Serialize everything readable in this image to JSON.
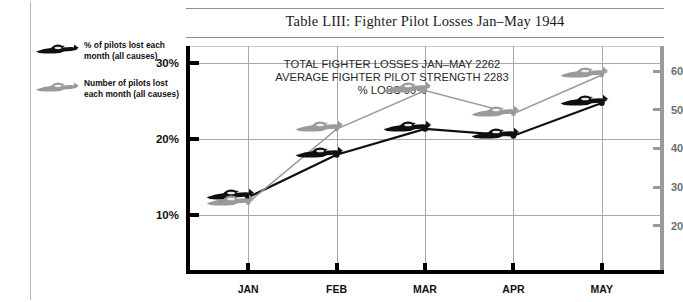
{
  "title": "Table LIII: Fighter Pilot Losses Jan–May 1944",
  "annotation": "TOTAL FIGHTER LOSSES JAN–MAY 2262\nAVERAGE FIGHTER PILOT STRENGTH 2283\n% LOSS 99%",
  "legend": [
    {
      "label": "% of pilots lost each month (all causes)",
      "icon": "fighter-plane-icon",
      "color": "#101010"
    },
    {
      "label": "Number of pilots lost each month (all causes)",
      "icon": "fighter-plane-icon",
      "color": "#9a9a9a"
    }
  ],
  "chart_data": {
    "type": "line",
    "title": "Table LIII: Fighter Pilot Losses Jan–May 1944",
    "xlabel": "",
    "ylabel": "% of pilots lost each month (all causes)",
    "ylabel_right": "Number of pilots lost each month (all causes)",
    "categories": [
      "JAN",
      "FEB",
      "MAR",
      "APR",
      "MAY"
    ],
    "grid": true,
    "legend_position": "top-left-outside",
    "series": [
      {
        "name": "% of pilots lost each month (all causes)",
        "axis": "left",
        "color": "#101010",
        "marker": "fighter-plane-icon",
        "values": [
          12.3,
          17.9,
          21.3,
          20.4,
          24.7
        ],
        "unit": "%"
      },
      {
        "name": "Number of pilots lost each month (all causes)",
        "axis": "right",
        "color": "#9a9a9a",
        "marker": "fighter-plane-icon",
        "values": [
          26,
          45,
          55,
          49,
          59
        ],
        "unit": "pilots"
      }
    ],
    "ylim": [
      2.2,
      32.2
    ],
    "yticks": [
      10,
      20,
      30
    ],
    "ytick_labels": [
      "10%",
      "20%",
      "30%"
    ],
    "ylim_right": [
      7.5,
      66.5
    ],
    "yticks_right": [
      20,
      30,
      40,
      50,
      60
    ],
    "ytick_labels_right": [
      "20",
      "30",
      "40",
      "50",
      "60"
    ],
    "annotations": [
      "TOTAL FIGHTER LOSSES JAN–MAY 2262",
      "AVERAGE FIGHTER PILOT STRENGTH 2283",
      "% LOSS 99%"
    ]
  }
}
